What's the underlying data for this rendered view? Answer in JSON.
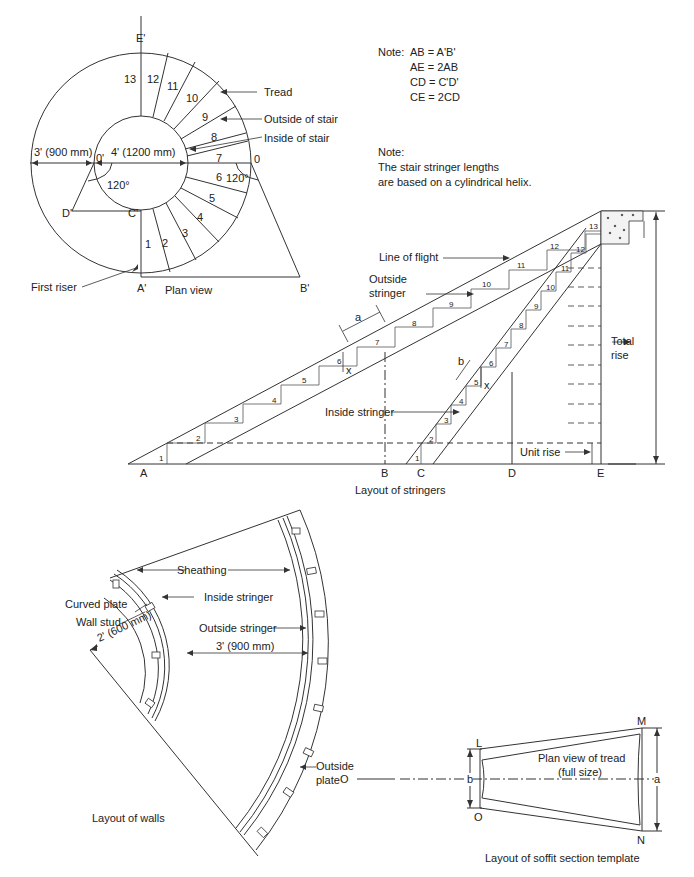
{
  "plan_view": {
    "caption": "Plan view",
    "points": {
      "E": "E'",
      "O_prime": "0'",
      "O": "0",
      "D": "D'",
      "C": "C'",
      "A": "A'",
      "B": "B'"
    },
    "dim_outer": "3' (900 mm)",
    "dim_inner": "4' (1200 mm)",
    "angle_left": "120°",
    "angle_right": "120°",
    "tread_numbers": [
      "1",
      "2",
      "3",
      "4",
      "5",
      "6",
      "7",
      "8",
      "9",
      "10",
      "11",
      "12",
      "13"
    ],
    "callouts": {
      "tread": "Tread",
      "outside": "Outside of stair",
      "inside": "Inside of stair",
      "first_riser": "First riser"
    }
  },
  "notes": {
    "note1_label": "Note:",
    "note1_lines": [
      "AB = A'B'",
      "AE = 2AB",
      "CD = C'D'",
      "CE = 2CD"
    ],
    "note2_label": "Note:",
    "note2_lines": [
      "The stair stringer lengths",
      "are based on a cylindrical helix."
    ]
  },
  "stringers": {
    "caption": "Layout of stringers",
    "points": {
      "A": "A",
      "B": "B",
      "C": "C",
      "D": "D",
      "E": "E"
    },
    "labels": {
      "line_of_flight": "Line of flight",
      "outside_stringer_1": "Outside",
      "outside_stringer_2": "stringer",
      "inside_stringer": "Inside stringer",
      "unit_rise": "Unit rise",
      "total_rise_1": "Total",
      "total_rise_2": "rise",
      "a": "a",
      "b": "b",
      "x1": "x",
      "x2": "x"
    },
    "outer_steps": [
      "1",
      "2",
      "3",
      "4",
      "5",
      "6",
      "7",
      "8",
      "9",
      "10",
      "11",
      "12",
      "13"
    ],
    "inner_steps": [
      "1",
      "2",
      "3",
      "4",
      "5",
      "6",
      "7",
      "8",
      "9",
      "10",
      "11",
      "12"
    ]
  },
  "walls": {
    "caption": "Layout of walls",
    "labels": {
      "sheathing": "Sheathing",
      "inside_stringer": "Inside stringer",
      "curved_plate": "Curved plate",
      "wall_stud": "Wall stud",
      "outside_stringer": "Outside stringer",
      "radius": "2' (600 mm)",
      "width": "3' (900 mm)",
      "outside_plate_1": "Outside",
      "outside_plate_2": "plate"
    }
  },
  "soffit": {
    "caption": "Layout of soffit section template",
    "labels": {
      "O_left": "O",
      "L": "L",
      "M": "M",
      "N": "N",
      "O": "O",
      "a": "a",
      "b": "b",
      "tread_1": "Plan view of tread",
      "tread_2": "(full size)"
    }
  }
}
